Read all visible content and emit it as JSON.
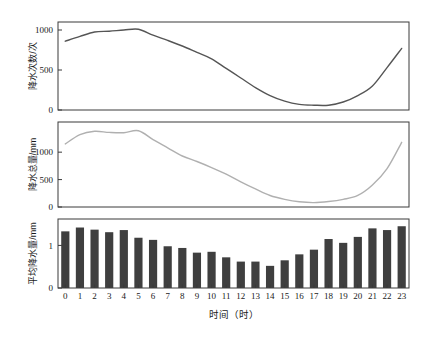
{
  "figure": {
    "xlabel": "时间（时）",
    "hours": [
      "0",
      "1",
      "2",
      "3",
      "4",
      "5",
      "6",
      "7",
      "8",
      "9",
      "10",
      "11",
      "12",
      "13",
      "14",
      "15",
      "16",
      "17",
      "18",
      "19",
      "20",
      "21",
      "22",
      "23"
    ],
    "colors": {
      "panel1_line": "#555555",
      "panel2_line": "#b0b0b0",
      "bar_fill": "#3f3f3f",
      "axis": "#3a3a3a",
      "background": "#ffffff"
    }
  },
  "chart_data": [
    {
      "type": "line",
      "panel": "top",
      "title": "",
      "ylabel": "降水次数/次",
      "xlabel": "时间（时）",
      "ylim": [
        0,
        1100
      ],
      "yticks": [
        0,
        500,
        1000
      ],
      "ytick_labels": [
        "0",
        "500",
        "1000"
      ],
      "xticks": [
        0,
        1,
        2,
        3,
        4,
        5,
        6,
        7,
        8,
        9,
        10,
        11,
        12,
        13,
        14,
        15,
        16,
        17,
        18,
        19,
        20,
        21,
        22,
        23
      ],
      "grid": false,
      "legend": "none",
      "x": [
        0,
        1,
        2,
        3,
        4,
        5,
        6,
        7,
        8,
        9,
        10,
        11,
        12,
        13,
        14,
        15,
        16,
        17,
        18,
        19,
        20,
        21,
        22,
        23
      ],
      "values": [
        860,
        920,
        975,
        985,
        1000,
        1010,
        935,
        870,
        800,
        720,
        640,
        520,
        400,
        280,
        180,
        110,
        70,
        60,
        60,
        100,
        180,
        300,
        530,
        770
      ],
      "series_name": "降水次数"
    },
    {
      "type": "line",
      "panel": "middle",
      "title": "",
      "ylabel": "降水总量/mm",
      "xlabel": "时间（时）",
      "ylim": [
        0,
        1550
      ],
      "yticks": [
        0,
        500,
        1000
      ],
      "ytick_labels": [
        "0",
        "500",
        "1000"
      ],
      "xticks": [
        0,
        1,
        2,
        3,
        4,
        5,
        6,
        7,
        8,
        9,
        10,
        11,
        12,
        13,
        14,
        15,
        16,
        17,
        18,
        19,
        20,
        21,
        22,
        23
      ],
      "grid": false,
      "legend": "none",
      "x": [
        0,
        1,
        2,
        3,
        4,
        5,
        6,
        7,
        8,
        9,
        10,
        11,
        12,
        13,
        14,
        15,
        16,
        17,
        18,
        19,
        20,
        21,
        22,
        23
      ],
      "values": [
        1150,
        1320,
        1380,
        1360,
        1355,
        1390,
        1230,
        1080,
        930,
        830,
        720,
        600,
        460,
        330,
        210,
        140,
        95,
        80,
        100,
        140,
        210,
        400,
        700,
        1180
      ],
      "series_name": "降水总量"
    },
    {
      "type": "bar",
      "panel": "bottom",
      "title": "",
      "ylabel": "平均降水量/mm",
      "xlabel": "时间（时）",
      "ylim": [
        0,
        1.62
      ],
      "yticks": [
        0,
        1
      ],
      "ytick_labels": [
        "0",
        "1"
      ],
      "grid": false,
      "legend": "none",
      "categories": [
        "0",
        "1",
        "2",
        "3",
        "4",
        "5",
        "6",
        "7",
        "8",
        "9",
        "10",
        "11",
        "12",
        "13",
        "14",
        "15",
        "16",
        "17",
        "18",
        "19",
        "20",
        "21",
        "22",
        "23"
      ],
      "values": [
        1.33,
        1.42,
        1.37,
        1.31,
        1.36,
        1.18,
        1.13,
        0.98,
        0.94,
        0.83,
        0.85,
        0.72,
        0.62,
        0.62,
        0.52,
        0.65,
        0.79,
        0.9,
        1.15,
        1.06,
        1.2,
        1.4,
        1.36,
        1.45
      ],
      "series_name": "平均降水量"
    }
  ]
}
